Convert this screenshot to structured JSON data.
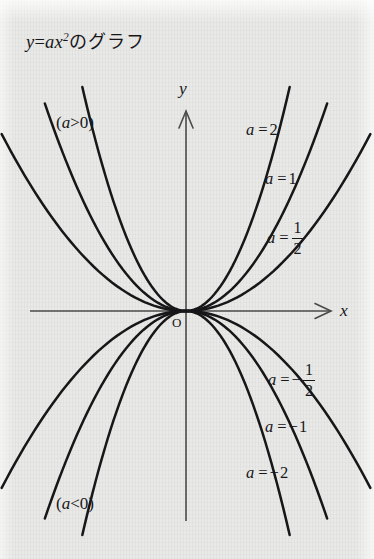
{
  "figure": {
    "title_lhs": "y",
    "title_eq": "=",
    "title_rhs": "ax",
    "title_exp": "2",
    "title_suffix": "のグラフ",
    "title_full": "y = ax² のグラフ",
    "background_color": "#e9e9e7",
    "ink_color": "#17171a",
    "axis_color": "#4a4a4a"
  },
  "axes": {
    "y_label": "y",
    "x_label": "x",
    "origin_label": "O",
    "origin_px": {
      "x": 186,
      "y": 311
    },
    "x_axis_px": {
      "x1": 30,
      "x2": 332,
      "y": 311
    },
    "y_axis_px": {
      "x": 186,
      "y1": 110,
      "y2": 521
    }
  },
  "regions": {
    "positive_label": "(a>0)",
    "positive_label_parts": {
      "open": "(",
      "var": "a",
      "rel": ">",
      "val": "0",
      "close": ")"
    },
    "negative_label": "(a<0)",
    "negative_label_parts": {
      "open": "(",
      "var": "a",
      "rel": "<",
      "val": "0",
      "close": ")"
    }
  },
  "curve_labels": [
    {
      "var": "a",
      "eq": "=",
      "sign": "",
      "value": "2",
      "frac": null,
      "text": "a = 2"
    },
    {
      "var": "a",
      "eq": "=",
      "sign": "",
      "value": "1",
      "frac": null,
      "text": "a = 1"
    },
    {
      "var": "a",
      "eq": "=",
      "sign": "",
      "value": "",
      "frac": {
        "num": "1",
        "den": "2"
      },
      "text": "a = 1/2"
    },
    {
      "var": "a",
      "eq": "=",
      "sign": "−",
      "value": "",
      "frac": {
        "num": "1",
        "den": "2"
      },
      "text": "a = -1/2"
    },
    {
      "var": "a",
      "eq": "=",
      "sign": "−",
      "value": "1",
      "frac": null,
      "text": "a = -1"
    },
    {
      "var": "a",
      "eq": "=",
      "sign": "−",
      "value": "2",
      "frac": null,
      "text": "a = -2"
    }
  ],
  "chart_data": {
    "type": "line",
    "xlabel": "x",
    "ylabel": "y",
    "grid": false,
    "legend_position": "inline-right",
    "axis_arrows": {
      "x": "right",
      "y": "up"
    },
    "xlim": [
      -2.6,
      2.6
    ],
    "ylim": [
      -2.2,
      2.2
    ],
    "function": "y = a*x^2",
    "series": [
      {
        "name": "a = 2",
        "a": 2,
        "color": "#17171a",
        "x": [
          -1.05,
          -0.8,
          -0.55,
          -0.3,
          0,
          0.3,
          0.55,
          0.8,
          1.05
        ],
        "y": [
          2.2,
          1.28,
          0.605,
          0.18,
          0,
          0.18,
          0.605,
          1.28,
          2.2
        ]
      },
      {
        "name": "a = 1",
        "a": 1,
        "color": "#17171a",
        "x": [
          -1.45,
          -1.1,
          -0.75,
          -0.4,
          0,
          0.4,
          0.75,
          1.1,
          1.45
        ],
        "y": [
          2.1,
          1.21,
          0.5625,
          0.16,
          0,
          0.16,
          0.5625,
          1.21,
          2.1
        ]
      },
      {
        "name": "a = 1/2",
        "a": 0.5,
        "color": "#17171a",
        "x": [
          -1.9,
          -1.45,
          -1.0,
          -0.5,
          0,
          0.5,
          1.0,
          1.45,
          1.9
        ],
        "y": [
          1.8,
          1.05,
          0.5,
          0.125,
          0,
          0.125,
          0.5,
          1.05,
          1.8
        ]
      },
      {
        "name": "a = -1/2",
        "a": -0.5,
        "color": "#17171a",
        "x": [
          -1.9,
          -1.45,
          -1.0,
          -0.5,
          0,
          0.5,
          1.0,
          1.45,
          1.9
        ],
        "y": [
          -1.8,
          -1.05,
          -0.5,
          -0.125,
          0,
          -0.125,
          -0.5,
          -1.05,
          -1.8
        ]
      },
      {
        "name": "a = -1",
        "a": -1,
        "color": "#17171a",
        "x": [
          -1.45,
          -1.1,
          -0.75,
          -0.4,
          0,
          0.4,
          0.75,
          1.1,
          1.45
        ],
        "y": [
          -2.1,
          -1.21,
          -0.5625,
          -0.16,
          0,
          -0.16,
          -0.5625,
          -1.21,
          -2.1
        ]
      },
      {
        "name": "a = -2",
        "a": -2,
        "color": "#17171a",
        "x": [
          -1.05,
          -0.8,
          -0.55,
          -0.3,
          0,
          0.3,
          0.55,
          0.8,
          1.05
        ],
        "y": [
          -2.2,
          -1.28,
          -0.605,
          -0.18,
          0,
          -0.18,
          -0.605,
          -1.28,
          -2.2
        ]
      }
    ],
    "annotations": [
      {
        "text": "(a>0)",
        "position": "upper-left"
      },
      {
        "text": "(a<0)",
        "position": "lower-left"
      },
      {
        "text": "O",
        "position": "origin"
      }
    ]
  }
}
